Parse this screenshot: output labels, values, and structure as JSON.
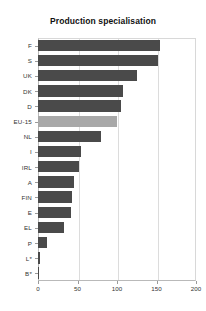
{
  "chart_data": {
    "type": "bar",
    "orientation": "horizontal",
    "title": "Production specialisation",
    "xlabel": "",
    "ylabel": "",
    "xlim": [
      0,
      200
    ],
    "xticks": [
      0,
      50,
      100,
      150,
      200
    ],
    "grid": true,
    "legend": "none",
    "highlight_category": "EU-15",
    "colors": {
      "bar": "#4a4a4a",
      "highlight_bar": "#a8a8a8",
      "grid": "#dcdcdc",
      "axis": "#b9b9b9",
      "text": "#333333",
      "title": "#111111",
      "background": "#ffffff"
    },
    "categories": [
      "F",
      "S",
      "UK",
      "DK",
      "D",
      "EU-15",
      "NL",
      "I",
      "IRL",
      "A",
      "FIN",
      "E",
      "EL",
      "P",
      "L*",
      "B*"
    ],
    "values": [
      155,
      152,
      125,
      108,
      105,
      100,
      80,
      55,
      52,
      45,
      43,
      42,
      33,
      12,
      2,
      1
    ]
  }
}
